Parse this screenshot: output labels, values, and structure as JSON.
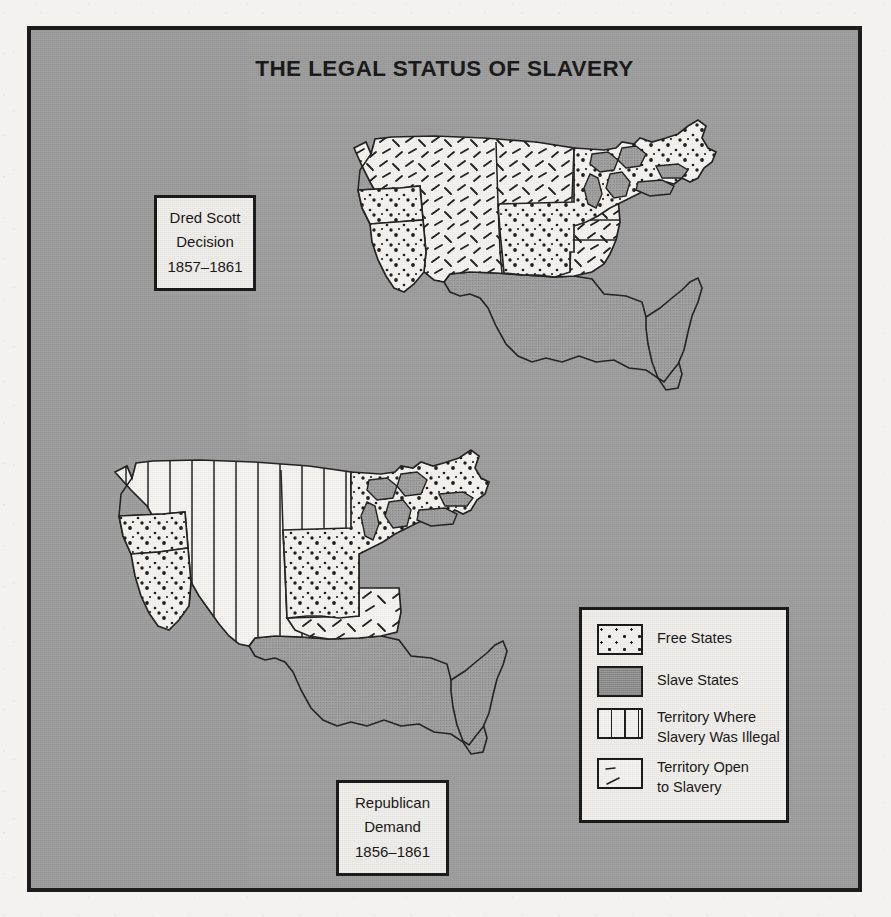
{
  "title": "THE LEGAL STATUS OF SLAVERY",
  "background_color": "#9d9d9d",
  "ink_color": "#161616",
  "paper_color": "#f0eeea",
  "callouts": [
    {
      "id": "dred-scott",
      "line1": "Dred Scott",
      "line2": "Decision",
      "line3": "1857–1861"
    },
    {
      "id": "republican-demand",
      "line1": "Republican",
      "line2": "Demand",
      "line3": "1856–1861"
    }
  ],
  "legend": {
    "items": [
      {
        "pattern": "dots",
        "label": "Free States",
        "label2": ""
      },
      {
        "pattern": "gray",
        "label": "Slave States",
        "label2": ""
      },
      {
        "pattern": "vertical-rule",
        "label": "Territory Where",
        "label2": "Slavery Was Illegal"
      },
      {
        "pattern": "dashes",
        "label": "Territory Open",
        "label2": "to Slavery"
      }
    ]
  },
  "maps": [
    {
      "id": "dred-scott-map",
      "caption_ref": "dred-scott",
      "regions": [
        {
          "name": "western-territories",
          "fill": "dashes",
          "meaning": "Territory Open to Slavery"
        },
        {
          "name": "oregon",
          "fill": "dots",
          "meaning": "Free State"
        },
        {
          "name": "california",
          "fill": "dots",
          "meaning": "Free State"
        },
        {
          "name": "northern-states",
          "fill": "dots",
          "meaning": "Free States"
        },
        {
          "name": "southern-states",
          "fill": "gray",
          "meaning": "Slave States"
        }
      ]
    },
    {
      "id": "republican-demand-map",
      "caption_ref": "republican-demand",
      "regions": [
        {
          "name": "western-territories",
          "fill": "vertical-rule",
          "meaning": "Territory Where Slavery Was Illegal"
        },
        {
          "name": "indian-territory",
          "fill": "dashes",
          "meaning": "Territory Open to Slavery"
        },
        {
          "name": "oregon",
          "fill": "dots",
          "meaning": "Free State"
        },
        {
          "name": "california",
          "fill": "dots",
          "meaning": "Free State"
        },
        {
          "name": "northern-states",
          "fill": "dots",
          "meaning": "Free States"
        },
        {
          "name": "southern-states",
          "fill": "gray",
          "meaning": "Slave States"
        }
      ]
    }
  ]
}
